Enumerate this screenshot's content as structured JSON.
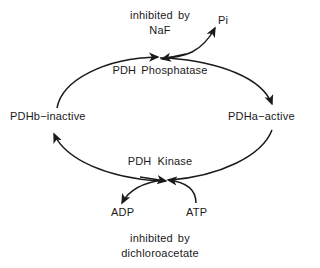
{
  "diagram": {
    "background_color": "#ffffff",
    "stroke_color": "#1a1a1a",
    "labels": {
      "inhibited_by": "inhibited",
      "by": "by",
      "naf": "NaF",
      "pi": "Pi",
      "pdh_phosphatase_word1": "PDH",
      "pdh_phosphatase_word2": "Phosphatase",
      "pdhb_inactive": "PDHb−inactive",
      "pdha_active": "PDHa−active",
      "pdh_kinase_word1": "PDH",
      "pdh_kinase_word2": "Kinase",
      "adp": "ADP",
      "atp": "ATP",
      "inhibited_by_bottom": "inhibited",
      "by_bottom": "by",
      "dichloroacetate": "dichloroacetate"
    }
  }
}
